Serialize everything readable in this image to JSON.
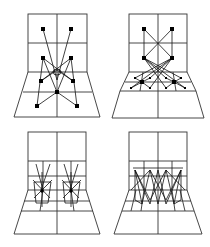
{
  "figure": {
    "colors": {
      "line": "#333333",
      "node": "#000000",
      "background": "#ffffff"
    },
    "panels": [
      {
        "id": "top-left",
        "origin": [
          0,
          0
        ],
        "wall_subdivided": false,
        "floor_subdivided": false,
        "big_nodes": [
          [
            43,
            29
          ],
          [
            71,
            29
          ],
          [
            43,
            58
          ],
          [
            71,
            58
          ],
          [
            41,
            81
          ],
          [
            73,
            81
          ],
          [
            57,
            92
          ],
          [
            37,
            106
          ],
          [
            77,
            106
          ]
        ],
        "small_nodes": [],
        "links": [
          [
            [
              43,
              29
            ],
            [
              57,
              80
            ]
          ],
          [
            [
              71,
              29
            ],
            [
              57,
              80
            ]
          ],
          [
            [
              43,
              58
            ],
            [
              73,
              81
            ]
          ],
          [
            [
              71,
              58
            ],
            [
              41,
              81
            ]
          ],
          [
            [
              43,
              58
            ],
            [
              57,
              92
            ]
          ],
          [
            [
              71,
              58
            ],
            [
              57,
              92
            ]
          ],
          [
            [
              43,
              58
            ],
            [
              37,
              106
            ]
          ],
          [
            [
              71,
              58
            ],
            [
              77,
              106
            ]
          ],
          [
            [
              41,
              81
            ],
            [
              71,
              58
            ]
          ],
          [
            [
              73,
              81
            ],
            [
              43,
              58
            ]
          ],
          [
            [
              57,
              92
            ],
            [
              37,
              106
            ]
          ],
          [
            [
              57,
              92
            ],
            [
              77,
              106
            ]
          ]
        ]
      },
      {
        "id": "top-right",
        "origin": [
          0,
          0
        ],
        "wall_subdivided": false,
        "floor_subdivided": true,
        "big_nodes": [
          [
            144,
            29
          ],
          [
            172,
            29
          ],
          [
            144,
            58
          ],
          [
            172,
            58
          ],
          [
            142,
            82
          ],
          [
            174,
            82
          ]
        ],
        "small_nodes": [
          [
            135,
            78
          ],
          [
            150,
            78
          ],
          [
            166,
            78
          ],
          [
            181,
            78
          ],
          [
            131,
            88
          ],
          [
            150,
            88
          ],
          [
            166,
            88
          ],
          [
            185,
            88
          ]
        ],
        "links": [
          [
            [
              144,
              29
            ],
            [
              172,
              58
            ]
          ],
          [
            [
              172,
              29
            ],
            [
              144,
              58
            ]
          ],
          [
            [
              144,
              29
            ],
            [
              144,
              58
            ]
          ],
          [
            [
              172,
              29
            ],
            [
              172,
              58
            ]
          ],
          [
            [
              144,
              58
            ],
            [
              181,
              78
            ]
          ],
          [
            [
              144,
              58
            ],
            [
              166,
              78
            ]
          ],
          [
            [
              144,
              58
            ],
            [
              185,
              88
            ]
          ],
          [
            [
              144,
              58
            ],
            [
              166,
              88
            ]
          ],
          [
            [
              172,
              58
            ],
            [
              135,
              78
            ]
          ],
          [
            [
              172,
              58
            ],
            [
              150,
              78
            ]
          ],
          [
            [
              172,
              58
            ],
            [
              131,
              88
            ]
          ],
          [
            [
              172,
              58
            ],
            [
              150,
              88
            ]
          ],
          [
            [
              142,
              82
            ],
            [
              135,
              78
            ]
          ],
          [
            [
              142,
              82
            ],
            [
              150,
              78
            ]
          ],
          [
            [
              142,
              82
            ],
            [
              131,
              88
            ]
          ],
          [
            [
              142,
              82
            ],
            [
              150,
              88
            ]
          ],
          [
            [
              174,
              82
            ],
            [
              166,
              78
            ]
          ],
          [
            [
              174,
              82
            ],
            [
              181,
              78
            ]
          ],
          [
            [
              174,
              82
            ],
            [
              166,
              88
            ]
          ],
          [
            [
              174,
              82
            ],
            [
              185,
              88
            ]
          ]
        ]
      },
      {
        "id": "bottom-left",
        "origin": [
          0,
          124
        ],
        "wall_subdivided": true,
        "floor_subdivided": true,
        "pattern": "two starburst clusters"
      },
      {
        "id": "bottom-right",
        "origin": [
          105,
          124
        ],
        "wall_subdivided": true,
        "floor_subdivided": true,
        "pattern": "zigzag crossing lines"
      }
    ]
  }
}
